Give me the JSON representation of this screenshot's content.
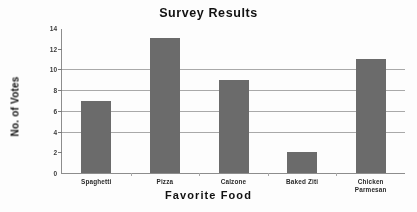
{
  "chart_data": {
    "type": "bar",
    "title": "Survey Results",
    "xlabel": "Favorite  Food",
    "ylabel": "No. of Votes",
    "categories": [
      "Spaghetti",
      "Pizza",
      "Calzone",
      "Baked Ziti",
      "Chicken\nParmesan"
    ],
    "values": [
      7,
      13,
      9,
      2,
      11
    ],
    "ylim": [
      0,
      14
    ],
    "yticks": [
      0,
      2,
      4,
      6,
      8,
      10,
      12,
      14
    ],
    "ytick_labels": [
      "0",
      "2",
      "4",
      "6",
      "8",
      "10",
      "12",
      "14"
    ],
    "gridlines_at": [
      4,
      6,
      8,
      10
    ],
    "grid": true,
    "legend": false,
    "bar_color": "#6b6b6b",
    "grid_color": "#9a9a9a",
    "axis_color": "#8d8d8d",
    "background": "#fdfdfd"
  }
}
